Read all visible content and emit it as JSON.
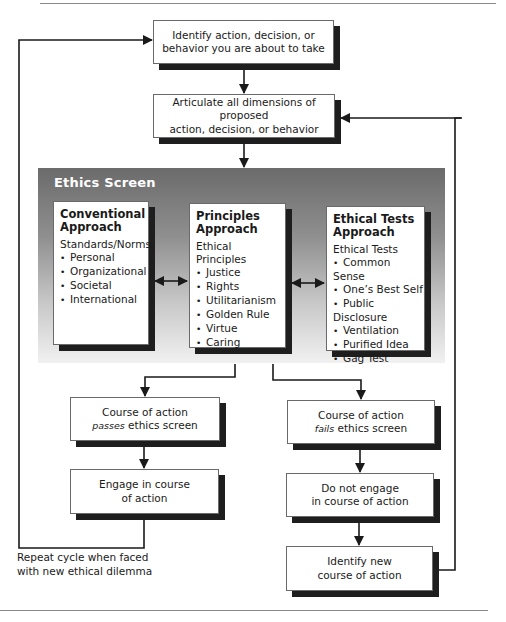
{
  "diagram": {
    "type": "flowchart",
    "step_identify": {
      "line1": "Identify action, decision, or",
      "line2": "behavior you are about to take"
    },
    "step_articulate": {
      "line1": "Articulate all dimensions of proposed",
      "line2": "action, decision, or behavior"
    },
    "ethics_screen": {
      "title": "Ethics Screen",
      "approaches": [
        {
          "title_line1": "Conventional",
          "title_line2": "Approach",
          "subtitle": "Standards/Norms",
          "items": [
            "Personal",
            "Organizational",
            "Societal",
            "International"
          ]
        },
        {
          "title_line1": "Principles",
          "title_line2": "Approach",
          "subtitle": "Ethical Principles",
          "items": [
            "Justice",
            "Rights",
            "Utilitarianism",
            "Golden Rule",
            "Virtue",
            "Caring"
          ]
        },
        {
          "title_line1": "Ethical Tests",
          "title_line2": "Approach",
          "subtitle": "Ethical Tests",
          "items": [
            "Common Sense",
            "One’s Best Self",
            "Public Disclosure",
            "Ventilation",
            "Purified Idea",
            "Gag Test"
          ]
        }
      ]
    },
    "pass_branch": {
      "result": {
        "line1": "Course of action",
        "emphasis": "passes",
        "line2_rest": " ethics screen"
      },
      "action": {
        "line1": "Engage in course",
        "line2": "of action"
      },
      "loop_caption": {
        "line1": "Repeat cycle when faced",
        "line2": "with new ethical dilemma"
      }
    },
    "fail_branch": {
      "result": {
        "line1": "Course of action",
        "emphasis": "fails",
        "line2_rest": " ethics screen"
      },
      "action": {
        "line1": "Do not engage",
        "line2": "in course of action"
      },
      "next": {
        "line1": "Identify new",
        "line2": "course of action"
      }
    }
  }
}
